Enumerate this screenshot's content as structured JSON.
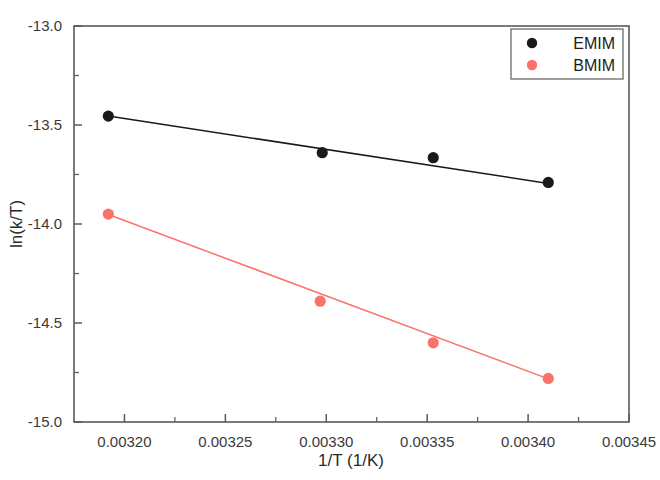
{
  "chart_data": {
    "type": "scatter",
    "title": "",
    "xlabel": "1/T (1/K)",
    "ylabel": "ln(k/T)",
    "xlim": [
      0.003175,
      0.00345
    ],
    "ylim": [
      -15.0,
      -13.0
    ],
    "grid": false,
    "legend_position": "top-right",
    "xticks": [
      0.0032,
      0.00325,
      0.0033,
      0.00335,
      0.0034,
      0.00345
    ],
    "xtick_labels": [
      "0.00320",
      "0.00325",
      "0.00330",
      "0.00335",
      "0.00340",
      "0.00345"
    ],
    "yticks": [
      -13.0,
      -13.5,
      -14.0,
      -14.5,
      -15.0
    ],
    "ytick_labels": [
      "-13.0",
      "-13.5",
      "-14.0",
      "-14.5",
      "-15.0"
    ],
    "xminor_count": 1,
    "yminor_count": 1,
    "series": [
      {
        "name": "EMIM",
        "color": "#1a1a1a",
        "marker": "circle",
        "x": [
          0.003192,
          0.003298,
          0.003353,
          0.00341
        ],
        "y": [
          -13.455,
          -13.64,
          -13.665,
          -13.79
        ],
        "fit_line": {
          "x": [
            0.003192,
            0.00341
          ],
          "y": [
            -13.455,
            -13.795
          ]
        }
      },
      {
        "name": "BMIM",
        "color": "#fa7268",
        "marker": "circle",
        "x": [
          0.003192,
          0.003297,
          0.003353,
          0.00341
        ],
        "y": [
          -13.95,
          -14.39,
          -14.6,
          -14.78
        ],
        "fit_line": {
          "x": [
            0.003192,
            0.00341
          ],
          "y": [
            -13.952,
            -14.782
          ]
        }
      }
    ]
  },
  "legend": {
    "entries": [
      {
        "label": "EMIM",
        "color": "#1a1a1a"
      },
      {
        "label": "BMIM",
        "color": "#fa7268"
      }
    ]
  },
  "axes": {
    "x_title": "1/T (1/K)",
    "y_title": "ln(k/T)"
  }
}
